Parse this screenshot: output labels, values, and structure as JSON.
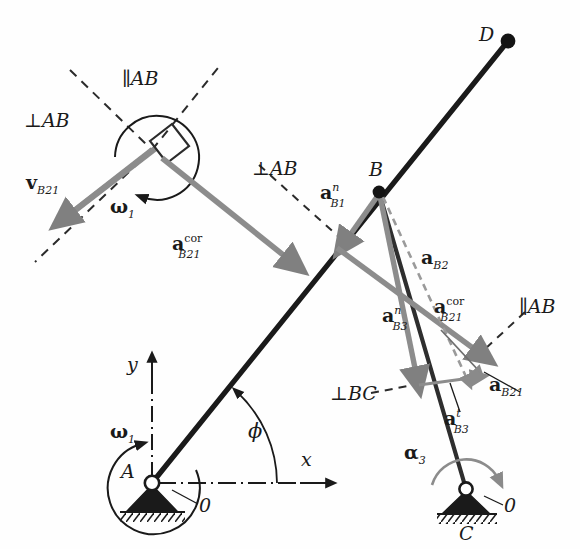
{
  "figure": {
    "background_color": "#fefefe",
    "link_color": "#1a1a1a",
    "vector_color": "#808080",
    "dash_color": "#2b2b2b"
  },
  "points": [
    {
      "name": "A",
      "label": "A",
      "x": 152,
      "y": 483,
      "kind": "ground-pivot"
    },
    {
      "name": "B",
      "label": "B",
      "x": 379,
      "y": 192,
      "kind": "joint"
    },
    {
      "name": "C",
      "label": "C",
      "x": 466,
      "y": 489,
      "kind": "ground-pivot"
    },
    {
      "name": "D",
      "label": "D",
      "x": 508,
      "y": 41,
      "kind": "link-end"
    },
    {
      "name": "slider",
      "label": "",
      "x": 152,
      "y": 150,
      "kind": "slider-block"
    }
  ],
  "ground_labels": {
    "pivot_a_zero": "0",
    "pivot_c_zero": "0"
  },
  "axes": {
    "x_label": "x",
    "y_label": "y",
    "angle_label": "ϕ"
  },
  "angular": {
    "omega1_at_slider": "ω",
    "omega1_at_slider_sub": "1",
    "omega1_at_a": "ω",
    "omega1_at_a_sub": "1",
    "alpha3_at_c": "α",
    "alpha3_at_c_sub": "3"
  },
  "construction_lines": [
    {
      "name": "perp-AB-upper-left",
      "label_main": "⊥",
      "label_sub": "AB",
      "label_x": 26,
      "label_y": 122
    },
    {
      "name": "parallel-AB-upper",
      "label_main": "∥",
      "label_sub": "AB",
      "label_x": 120,
      "label_y": 80
    },
    {
      "name": "perp-AB-middle",
      "label_main": "⊥",
      "label_sub": "AB",
      "label_x": 256,
      "label_y": 170
    },
    {
      "name": "parallel-AB-right",
      "label_main": "∥",
      "label_sub": "AB",
      "label_x": 520,
      "label_y": 307
    },
    {
      "name": "perp-BC-lower",
      "label_main": "⊥",
      "label_sub": "BC",
      "label_x": 337,
      "label_y": 396
    }
  ],
  "vectors": [
    {
      "name": "v-B21",
      "base": "v",
      "sub": "B",
      "sub2": "21",
      "label_x": 28,
      "label_y": 186,
      "from": [
        152,
        150
      ],
      "to": [
        64,
        219
      ],
      "style": "solid-gray",
      "description": "relative sliding velocity of B on link 2 w.r.t. link 1"
    },
    {
      "name": "a-cor-B21-left",
      "base": "a",
      "sup": "cor",
      "sub": "B",
      "sub2": "21",
      "label_x": 175,
      "label_y": 243,
      "from": [
        160,
        157
      ],
      "to": [
        291,
        261
      ],
      "style": "solid-gray",
      "description": "Coriolis acceleration drawn at the slider"
    },
    {
      "name": "a-n-B1",
      "base": "a",
      "sup": "n",
      "sub": "B",
      "sub2": "1",
      "label_x": 324,
      "label_y": 193,
      "from": [
        379,
        194
      ],
      "to": [
        342,
        243
      ],
      "style": "solid-gray",
      "description": "normal acceleration of point B on link 1"
    },
    {
      "name": "a-B2",
      "base": "a",
      "sub": "B",
      "sub2": "2",
      "label_x": 425,
      "label_y": 258,
      "from": [
        382,
        196
      ],
      "to": [
        466,
        380
      ],
      "style": "dashed-gray",
      "description": "total acceleration of point B on link 2"
    },
    {
      "name": "a-cor-B21-right",
      "base": "a",
      "sup": "cor",
      "sub": "B",
      "sub2": "21",
      "label_x": 438,
      "label_y": 307,
      "from": [
        337,
        248
      ],
      "to": [
        481,
        355
      ],
      "style": "solid-gray",
      "description": "Coriolis acceleration component at B"
    },
    {
      "name": "a-n-B3",
      "base": "a",
      "sup": "n",
      "sub": "B",
      "sub2": "3",
      "label_x": 386,
      "label_y": 316,
      "from": [
        379,
        196
      ],
      "to": [
        418,
        379
      ],
      "style": "solid-gray",
      "description": "normal acceleration of point B on link 3 toward C"
    },
    {
      "name": "a-t-B3",
      "base": "a",
      "sup": "t",
      "sub": "B",
      "sub2": "3",
      "label_x": 447,
      "label_y": 419,
      "from": [
        419,
        384
      ],
      "to": [
        479,
        376
      ],
      "style": "solid-gray-thin",
      "description": "tangential acceleration of point B on link 3"
    },
    {
      "name": "a-B21",
      "base": "a",
      "sub": "B",
      "sub2": "21",
      "label_x": 492,
      "label_y": 385,
      "from": [
        441,
        330
      ],
      "to": [
        480,
        372
      ],
      "style": "dashed-gray",
      "description": "relative sliding acceleration of B on link 2 w.r.t. link 1"
    }
  ],
  "links": [
    {
      "name": "link-AD",
      "from": [
        152,
        483
      ],
      "to": [
        508,
        41
      ],
      "style": "thick-dark",
      "description": "rotating link from ground pivot A through B to end D"
    },
    {
      "name": "link-BC",
      "from": [
        379,
        192
      ],
      "to": [
        466,
        489
      ],
      "style": "thick-dark",
      "description": "link from joint B to ground pivot C"
    },
    {
      "name": "slider-bar",
      "from": [
        152,
        150
      ],
      "to": [
        64,
        219
      ],
      "style": "thick-gray",
      "description": "slider guide bar at the upper left block"
    }
  ]
}
